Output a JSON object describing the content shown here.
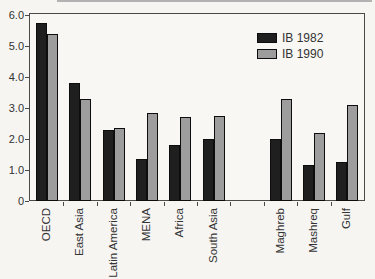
{
  "chart_data": {
    "type": "bar",
    "title": "",
    "categories": [
      "OECD",
      "East Asia",
      "Latin America",
      "MENA",
      "Africa",
      "South Asia",
      "Maghreb",
      "Mashreq",
      "Gulf"
    ],
    "category_slots": [
      0,
      1,
      2,
      3,
      4,
      5,
      7,
      8,
      9
    ],
    "n_slots": 10,
    "series": [
      {
        "name": "IB 1982",
        "color": "#1f1f1f",
        "values": [
          5.75,
          3.8,
          2.3,
          1.35,
          1.8,
          2.0,
          2.0,
          1.15,
          1.25
        ]
      },
      {
        "name": "IB 1990",
        "color": "#9d9d9d",
        "values": [
          5.4,
          3.3,
          2.35,
          2.85,
          2.7,
          2.75,
          3.3,
          2.2,
          3.1
        ]
      }
    ],
    "xlabel": "",
    "ylabel": "",
    "ylim": [
      0,
      6
    ],
    "y_ticks": [
      "6.0",
      "5.0",
      "4.0",
      "3.0",
      "2.0",
      "1.0",
      "0"
    ],
    "y_tick_values": [
      6,
      5,
      4,
      3,
      2,
      1,
      0
    ],
    "grid": false,
    "legend_position": "upper-right",
    "colors": {
      "frame": "#4a4a4a",
      "background": "#f6f5f2",
      "text": "#333333"
    }
  }
}
